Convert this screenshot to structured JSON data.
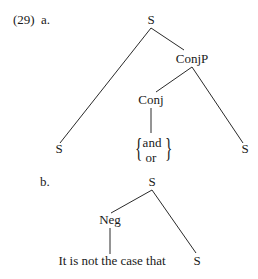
{
  "example_number": "(29)",
  "tree_a": {
    "label": "a.",
    "root": "S",
    "conjp": "ConjP",
    "conj": "Conj",
    "left_s": "S",
    "right_s": "S",
    "conj_options": [
      "and",
      "or"
    ]
  },
  "tree_b": {
    "label": "b.",
    "root": "S",
    "neg": "Neg",
    "neg_text": "It is not the case that",
    "s": "S"
  }
}
